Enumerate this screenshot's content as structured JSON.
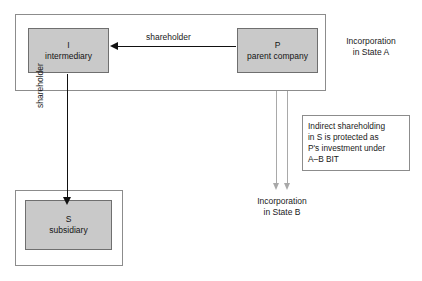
{
  "diagram": {
    "colors": {
      "entity_fill": "#c9c9c9",
      "entity_border": "#6f6f6f",
      "frame_border": "#8c8c8c",
      "arrow_black": "#111111",
      "arrow_gray": "#a9a9a9",
      "background": "#ffffff",
      "text": "#1a1a1a"
    },
    "entities": [
      {
        "id": "intermediary",
        "letter": "I",
        "name": "intermediary"
      },
      {
        "id": "parent",
        "letter": "P",
        "name": "parent company"
      },
      {
        "id": "subsidiary",
        "letter": "S",
        "name": "subsidiary"
      }
    ],
    "edges": [
      {
        "id": "parent-to-intermediary",
        "label": "shareholder",
        "from": "P",
        "to": "I",
        "direction": "left",
        "style": "black-solid"
      },
      {
        "id": "intermediary-to-subsidiary",
        "label": "shareholder",
        "from": "I",
        "to": "S",
        "direction": "down",
        "style": "black-solid"
      }
    ],
    "jurisdictions": [
      {
        "id": "state-a",
        "line1": "Incorporation",
        "line2": "in State A"
      },
      {
        "id": "state-b",
        "line1": "Incorporation",
        "line2": "in State B"
      }
    ],
    "note": {
      "line1": "Indirect shareholding",
      "line2": "in S is protected as",
      "line3": "P's investment under",
      "line4": "A–B BIT"
    }
  }
}
